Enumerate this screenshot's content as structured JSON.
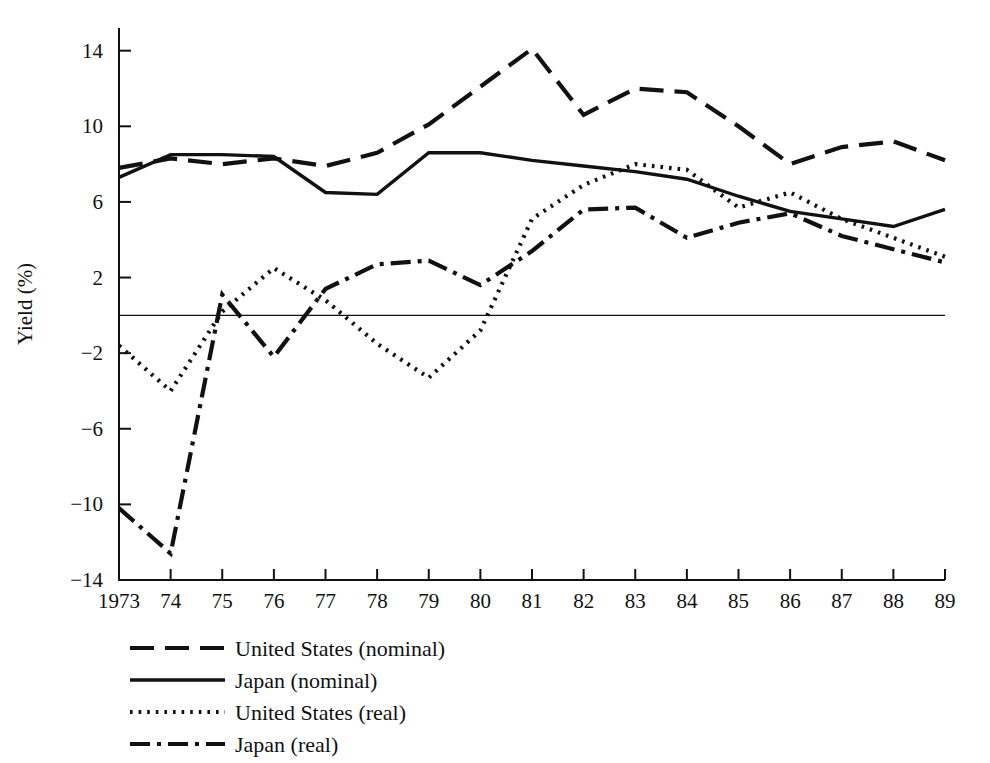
{
  "chart_data": {
    "type": "line",
    "title": "",
    "xlabel": "",
    "ylabel": "Yield (%)",
    "x": [
      1973,
      1974,
      1975,
      1976,
      1977,
      1978,
      1979,
      1980,
      1981,
      1982,
      1983,
      1984,
      1985,
      1986,
      1987,
      1988,
      1989
    ],
    "xtick_labels": [
      "1973",
      "74",
      "75",
      "76",
      "77",
      "78",
      "79",
      "80",
      "81",
      "82",
      "83",
      "84",
      "85",
      "86",
      "87",
      "88",
      "89"
    ],
    "ytick_labels": [
      "14",
      "10",
      "6",
      "2",
      "−2",
      "−6",
      "−10",
      "−14"
    ],
    "ytick_values": [
      14,
      10,
      6,
      2,
      -2,
      -6,
      -10,
      -14
    ],
    "ylim": [
      -14,
      15.2
    ],
    "xlim": [
      1973,
      1989
    ],
    "grid": false,
    "zero_line": true,
    "legend_position": "below-axes",
    "series": [
      {
        "name": "United States (nominal)",
        "style": "dashed",
        "color": "#111111",
        "values": [
          7.8,
          8.3,
          8.0,
          8.3,
          7.9,
          8.6,
          10.1,
          12.1,
          14.1,
          10.6,
          12.0,
          11.8,
          10.0,
          8.0,
          8.9,
          9.2,
          8.2
        ]
      },
      {
        "name": "Japan (nominal)",
        "style": "solid",
        "color": "#111111",
        "values": [
          7.3,
          8.5,
          8.5,
          8.4,
          6.5,
          6.4,
          8.6,
          8.6,
          8.2,
          7.9,
          7.6,
          7.2,
          6.3,
          5.5,
          5.1,
          4.7,
          5.6
        ]
      },
      {
        "name": "United States (real)",
        "style": "dotted",
        "color": "#111111",
        "values": [
          -1.6,
          -4.0,
          0.2,
          2.5,
          0.8,
          -1.5,
          -3.3,
          -0.8,
          5.1,
          6.9,
          8.0,
          7.7,
          5.7,
          6.5,
          5.1,
          4.1,
          3.1
        ]
      },
      {
        "name": "Japan (real)",
        "style": "dashdot",
        "color": "#111111",
        "values": [
          -10.2,
          -12.6,
          1.1,
          -2.2,
          1.4,
          2.7,
          2.9,
          1.6,
          3.4,
          5.6,
          5.7,
          4.1,
          4.9,
          5.4,
          4.2,
          3.5,
          2.8
        ]
      }
    ]
  },
  "legend": {
    "items": [
      {
        "label": "United States (nominal)",
        "style": "dashed"
      },
      {
        "label": "Japan (nominal)",
        "style": "solid"
      },
      {
        "label": "United States (real)",
        "style": "dotted"
      },
      {
        "label": "Japan (real)",
        "style": "dashdot"
      }
    ]
  }
}
